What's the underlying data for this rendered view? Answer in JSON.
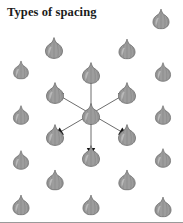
{
  "figure": {
    "title": "Types of spacing",
    "width": 183,
    "height": 223,
    "background_color": "#ffffff",
    "border_color": "#9a9a9a",
    "title_color": "#1b1b1b"
  },
  "bulb": {
    "icon_name": "garlic-bulb-icon",
    "fill_color": "#9d9d9d",
    "outline_color": "#5a5a5a",
    "highlight_color": "#c3c3c3",
    "shadow_color": "#6f6f6f",
    "default_width": 19,
    "default_height": 22
  },
  "arrows": {
    "icon_name": "spacing-arrow-icon",
    "line_color": "#6d6d6d",
    "head_color": "#141414",
    "line_width": 1,
    "count": 6,
    "origin": {
      "x": 91,
      "y": 114
    },
    "directions": [
      {
        "name": "up",
        "angle_deg": 90,
        "target": {
          "x": 91,
          "y": 73
        }
      },
      {
        "name": "down",
        "angle_deg": 270,
        "target": {
          "x": 91,
          "y": 156
        }
      },
      {
        "name": "upper-left",
        "angle_deg": 150,
        "target": {
          "x": 55,
          "y": 93
        }
      },
      {
        "name": "upper-right",
        "angle_deg": 30,
        "target": {
          "x": 127,
          "y": 93
        }
      },
      {
        "name": "lower-left",
        "angle_deg": 210,
        "target": {
          "x": 55,
          "y": 135
        }
      },
      {
        "name": "lower-right",
        "angle_deg": 330,
        "target": {
          "x": 127,
          "y": 135
        }
      }
    ]
  },
  "plants": [
    {
      "id": "bulb-r0-c4",
      "x": 161,
      "y": 19,
      "w": 18,
      "h": 21,
      "row": 0,
      "col": 4
    },
    {
      "id": "bulb-r1-c1",
      "x": 54,
      "y": 48,
      "w": 19,
      "h": 22,
      "row": 1,
      "col": 1
    },
    {
      "id": "bulb-r1-c3",
      "x": 127,
      "y": 49,
      "w": 18,
      "h": 21,
      "row": 1,
      "col": 3
    },
    {
      "id": "bulb-r2-c0",
      "x": 21,
      "y": 70,
      "w": 17,
      "h": 19,
      "row": 2,
      "col": 0
    },
    {
      "id": "bulb-r2-c2",
      "x": 91,
      "y": 73,
      "w": 19,
      "h": 22,
      "row": 2,
      "col": 2,
      "arrow_target": "up"
    },
    {
      "id": "bulb-r2-c4",
      "x": 163,
      "y": 72,
      "w": 17,
      "h": 20,
      "row": 2,
      "col": 4
    },
    {
      "id": "bulb-r3-c1",
      "x": 55,
      "y": 93,
      "w": 19,
      "h": 22,
      "row": 3,
      "col": 1,
      "arrow_target": "upper-left"
    },
    {
      "id": "bulb-r3-c3",
      "x": 127,
      "y": 93,
      "w": 19,
      "h": 22,
      "row": 3,
      "col": 3,
      "arrow_target": "upper-right"
    },
    {
      "id": "bulb-center",
      "x": 91,
      "y": 114,
      "w": 20,
      "h": 22,
      "row": 4,
      "col": 2,
      "is_center": true
    },
    {
      "id": "bulb-r4-c0",
      "x": 21,
      "y": 115,
      "w": 17,
      "h": 20,
      "row": 4,
      "col": 0
    },
    {
      "id": "bulb-r4-c4",
      "x": 163,
      "y": 115,
      "w": 17,
      "h": 20,
      "row": 4,
      "col": 4
    },
    {
      "id": "bulb-r5-c1",
      "x": 55,
      "y": 135,
      "w": 19,
      "h": 22,
      "row": 5,
      "col": 1,
      "arrow_target": "lower-left"
    },
    {
      "id": "bulb-r5-c3",
      "x": 127,
      "y": 135,
      "w": 19,
      "h": 22,
      "row": 5,
      "col": 3,
      "arrow_target": "lower-right"
    },
    {
      "id": "bulb-r6-c2",
      "x": 91,
      "y": 156,
      "w": 19,
      "h": 22,
      "row": 6,
      "col": 2,
      "arrow_target": "down"
    },
    {
      "id": "bulb-r6-c0",
      "x": 21,
      "y": 160,
      "w": 17,
      "h": 20,
      "row": 6,
      "col": 0
    },
    {
      "id": "bulb-r6-c4",
      "x": 163,
      "y": 158,
      "w": 17,
      "h": 20,
      "row": 6,
      "col": 4
    },
    {
      "id": "bulb-r7-c1",
      "x": 55,
      "y": 180,
      "w": 19,
      "h": 21,
      "row": 7,
      "col": 1
    },
    {
      "id": "bulb-r7-c3",
      "x": 127,
      "y": 180,
      "w": 19,
      "h": 21,
      "row": 7,
      "col": 3
    },
    {
      "id": "bulb-r8-c0",
      "x": 21,
      "y": 205,
      "w": 18,
      "h": 21,
      "row": 8,
      "col": 0
    },
    {
      "id": "bulb-r8-c2",
      "x": 91,
      "y": 205,
      "w": 18,
      "h": 21,
      "row": 8,
      "col": 2
    },
    {
      "id": "bulb-r8-c4",
      "x": 163,
      "y": 207,
      "w": 18,
      "h": 21,
      "row": 8,
      "col": 4
    }
  ]
}
